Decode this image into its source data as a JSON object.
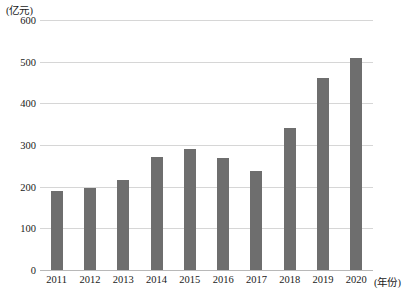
{
  "chart_data": {
    "type": "bar",
    "title": "",
    "subtitle": "",
    "xlabel": "(年份)",
    "ylabel": "(亿元)",
    "categories": [
      "2011",
      "2012",
      "2013",
      "2014",
      "2015",
      "2016",
      "2017",
      "2018",
      "2019",
      "2020"
    ],
    "values": [
      190,
      197,
      215,
      272,
      291,
      268,
      237,
      342,
      462,
      508
    ],
    "ylim": [
      0,
      600
    ],
    "ytick_labels": [
      "0",
      "100",
      "200",
      "300",
      "400",
      "500",
      "600"
    ],
    "ytick_values": [
      0,
      100,
      200,
      300,
      400,
      500,
      600
    ],
    "grid": true,
    "grid_axis": "y",
    "legend": false,
    "legend_position": "none",
    "series": [
      {
        "name": "",
        "values": [
          190,
          197,
          215,
          272,
          291,
          268,
          237,
          342,
          462,
          508
        ]
      }
    ],
    "bar_color": "#6e6e6e",
    "grid_color": "#d6d6d6",
    "axis_color": "#b8b8b8",
    "background_color": "#ffffff",
    "text_color": "#1a1a1a"
  }
}
